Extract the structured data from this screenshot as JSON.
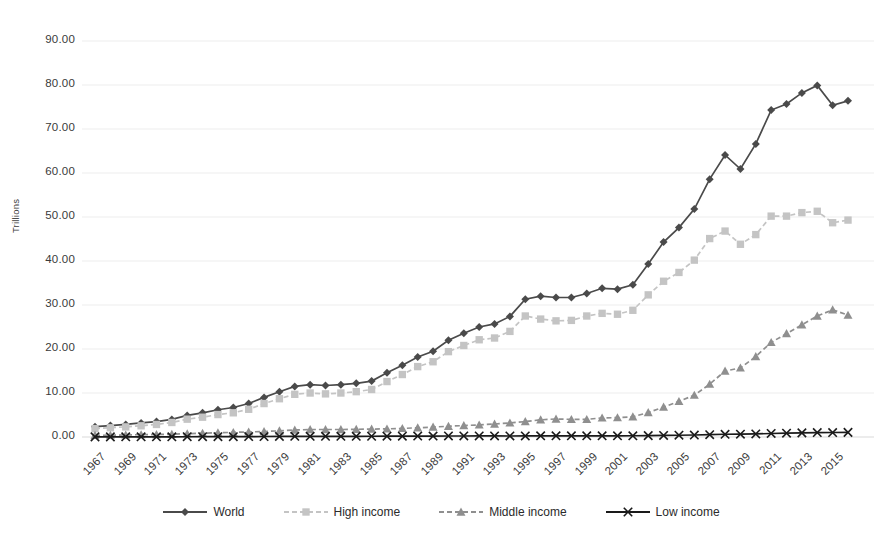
{
  "chart_data": {
    "type": "line",
    "title": "",
    "subtitle": "",
    "xlabel": "",
    "ylabel": "Trillions",
    "ylim": [
      0,
      90
    ],
    "ytick_step": 10,
    "ytick_format": "0.00",
    "yticks": [
      "0.00",
      "10.00",
      "20.00",
      "30.00",
      "40.00",
      "50.00",
      "60.00",
      "70.00",
      "80.00",
      "90.00"
    ],
    "ytick_values": [
      0,
      10,
      20,
      30,
      40,
      50,
      60,
      70,
      80,
      90
    ],
    "grid": true,
    "grid_axis": "y",
    "legend_position": "bottom",
    "x": [
      1967,
      1968,
      1969,
      1970,
      1971,
      1972,
      1973,
      1974,
      1975,
      1976,
      1977,
      1978,
      1979,
      1980,
      1981,
      1982,
      1983,
      1984,
      1985,
      1986,
      1987,
      1988,
      1989,
      1990,
      1991,
      1992,
      1993,
      1994,
      1995,
      1996,
      1997,
      1998,
      1999,
      2000,
      2001,
      2002,
      2003,
      2004,
      2005,
      2006,
      2007,
      2008,
      2009,
      2010,
      2011,
      2012,
      2013,
      2014,
      2015,
      2016
    ],
    "xtick_labels": [
      "1967",
      "1969",
      "1971",
      "1973",
      "1975",
      "1977",
      "1979",
      "1981",
      "1983",
      "1985",
      "1987",
      "1989",
      "1991",
      "1993",
      "1995",
      "1997",
      "1999",
      "2001",
      "2003",
      "2005",
      "2007",
      "2009",
      "2011",
      "2013",
      "2015"
    ],
    "xtick_rotation": -45,
    "series": [
      {
        "name": "World",
        "color": "#4a4a4a",
        "marker": "diamond",
        "line_style": "solid",
        "values": [
          2.35,
          2.6,
          2.85,
          3.2,
          3.5,
          4.0,
          4.9,
          5.5,
          6.2,
          6.7,
          7.6,
          9.0,
          10.3,
          11.5,
          11.9,
          11.7,
          11.9,
          12.2,
          12.7,
          14.6,
          16.3,
          18.2,
          19.5,
          22.0,
          23.6,
          25.0,
          25.7,
          27.4,
          31.3,
          32.0,
          31.7,
          31.7,
          32.6,
          33.8,
          33.6,
          34.6,
          39.3,
          44.3,
          47.6,
          51.8,
          58.6,
          64.1,
          60.9,
          66.6,
          74.3,
          75.7,
          78.2,
          79.9,
          75.4,
          76.4
        ]
      },
      {
        "name": "High income",
        "color": "#c4c4c4",
        "marker": "square",
        "line_style": "dashed",
        "values": [
          1.9,
          2.1,
          2.3,
          2.55,
          2.85,
          3.3,
          4.05,
          4.5,
          5.1,
          5.5,
          6.3,
          7.6,
          8.7,
          9.7,
          10.0,
          9.8,
          10.0,
          10.3,
          10.8,
          12.6,
          14.2,
          16.0,
          17.1,
          19.4,
          20.8,
          22.1,
          22.5,
          24.0,
          27.5,
          26.8,
          26.4,
          26.5,
          27.5,
          28.1,
          27.9,
          28.8,
          32.3,
          35.4,
          37.4,
          40.2,
          45.1,
          46.8,
          43.8,
          46.0,
          50.2,
          50.2,
          51.0,
          51.3,
          48.7,
          49.3
        ]
      },
      {
        "name": "Middle income",
        "color": "#8f8f8f",
        "marker": "triangle",
        "line_style": "dashed",
        "values": [
          0.38,
          0.42,
          0.47,
          0.53,
          0.57,
          0.63,
          0.75,
          0.87,
          0.97,
          1.05,
          1.15,
          1.25,
          1.4,
          1.6,
          1.7,
          1.7,
          1.7,
          1.75,
          1.8,
          1.85,
          1.95,
          2.1,
          2.25,
          2.45,
          2.6,
          2.75,
          2.95,
          3.2,
          3.5,
          3.9,
          4.1,
          4.0,
          4.0,
          4.35,
          4.4,
          4.6,
          5.55,
          6.8,
          8.1,
          9.5,
          12.0,
          15.0,
          15.7,
          18.3,
          21.5,
          23.5,
          25.5,
          27.5,
          28.9,
          27.7
        ]
      },
      {
        "name": "Low income",
        "color": "#1a1a1a",
        "marker": "cross",
        "line_style": "solid",
        "values": [
          0.03,
          0.03,
          0.04,
          0.04,
          0.04,
          0.05,
          0.06,
          0.07,
          0.08,
          0.08,
          0.09,
          0.11,
          0.13,
          0.15,
          0.16,
          0.16,
          0.16,
          0.16,
          0.17,
          0.18,
          0.19,
          0.21,
          0.22,
          0.23,
          0.23,
          0.24,
          0.24,
          0.23,
          0.25,
          0.27,
          0.27,
          0.27,
          0.27,
          0.27,
          0.27,
          0.28,
          0.31,
          0.35,
          0.4,
          0.45,
          0.53,
          0.62,
          0.64,
          0.7,
          0.8,
          0.87,
          0.94,
          1.01,
          1.02,
          1.05
        ]
      }
    ]
  },
  "legend": {
    "items": [
      {
        "label": "World"
      },
      {
        "label": "High income"
      },
      {
        "label": "Middle income"
      },
      {
        "label": "Low income"
      }
    ]
  },
  "axis": {
    "y_title": "Trillions"
  }
}
